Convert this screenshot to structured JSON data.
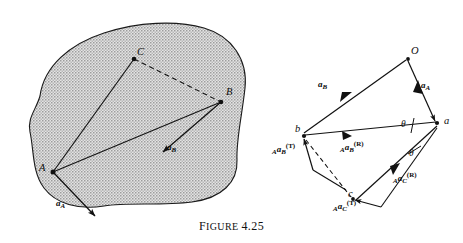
{
  "figure": {
    "caption_word": "F",
    "caption_small": "IGURE",
    "caption_number": "4.25",
    "caption_full": "FIGURE 4.25"
  },
  "left_diagram": {
    "name": "rigid-body-with-points",
    "shape": "irregular stippled blob",
    "fill_color": "#c9c9c9",
    "stroke_color": "#1a1a1a",
    "points": [
      {
        "id": "A",
        "label": "A",
        "x": 53,
        "y": 172
      },
      {
        "id": "B",
        "label": "B",
        "x": 221,
        "y": 102
      },
      {
        "id": "C",
        "label": "C",
        "x": 134,
        "y": 59
      }
    ],
    "lines": [
      {
        "name": "segment-A-C",
        "from": "A",
        "to": "C",
        "style": "solid"
      },
      {
        "name": "segment-A-B",
        "from": "A",
        "to": "B",
        "style": "solid"
      },
      {
        "name": "segment-C-B",
        "from": "C",
        "to": "B",
        "style": "dashed"
      }
    ],
    "vectors": [
      {
        "name": "acceleration-of-B",
        "label_base": "a",
        "label_sub": "B",
        "tail": "B",
        "tip_x": 161,
        "tip_y": 151,
        "label_x": 167,
        "label_y": 146
      },
      {
        "name": "acceleration-of-A",
        "label_base": "a",
        "label_sub": "A",
        "tail": "A",
        "tip_x": 93,
        "tip_y": 214,
        "label_x": 57,
        "label_y": 203
      }
    ]
  },
  "right_diagram": {
    "name": "acceleration-polygon",
    "pole_label": "O",
    "points": [
      {
        "id": "O",
        "label": "O",
        "x": 408,
        "y": 57
      },
      {
        "id": "a",
        "label": "a",
        "x": 437,
        "y": 123
      },
      {
        "id": "b",
        "label": "b",
        "x": 303,
        "y": 136
      },
      {
        "id": "c",
        "label": "c",
        "x": 352,
        "y": 199
      }
    ],
    "vectors": [
      {
        "name": "vector-Oa-acceleration-A",
        "label_base": "a",
        "label_sub": "A",
        "from": "O",
        "to": "a",
        "label_x": 420,
        "label_y": 85
      },
      {
        "name": "vector-Ob-acceleration-B",
        "label_base": "a",
        "label_sub": "B",
        "from": "O",
        "to": "b",
        "label_x": 321,
        "label_y": 84
      },
      {
        "name": "vector-ab-radial-B",
        "pre_sub": "A",
        "label_base": "a",
        "label_sub": "B",
        "label_sup": "(R)",
        "from": "a",
        "to": "b",
        "label_x": 354,
        "label_y": 148
      },
      {
        "name": "vector-b-tangential-B",
        "pre_sub": "A",
        "label_base": "a",
        "label_sub": "B",
        "label_sup": "(T)",
        "label_x": 274,
        "label_y": 150
      },
      {
        "name": "vector-ac-radial-C",
        "pre_sub": "A",
        "label_base": "a",
        "label_sub": "C",
        "label_sup": "(R)",
        "from": "a",
        "to": "c",
        "label_x": 398,
        "label_y": 178
      },
      {
        "name": "vector-c-tangential-C",
        "pre_sub": "A",
        "label_base": "a",
        "label_sub": "C",
        "label_sup": "(T)",
        "label_x": 337,
        "label_y": 206
      }
    ],
    "angles": [
      {
        "name": "angle-theta-upper",
        "label": "θ",
        "x": 405,
        "y": 126,
        "vertex": "a"
      },
      {
        "name": "angle-theta-lower",
        "label": "θ",
        "x": 412,
        "y": 155,
        "vertex": "a"
      }
    ],
    "theta_symbol": "θ",
    "superscript_radial": "(R)",
    "superscript_tangential": "(T)",
    "prefix_subscript": "A"
  }
}
